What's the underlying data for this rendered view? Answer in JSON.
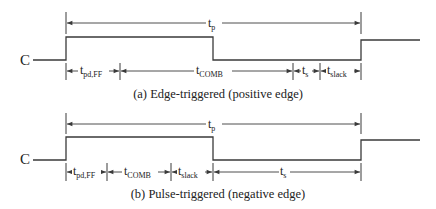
{
  "figure": {
    "panels": [
      {
        "id": "a",
        "caption": "(a) Edge-triggered (positive edge)",
        "signal_label": "C",
        "period": {
          "label": "t",
          "sub": "p"
        },
        "intervals": [
          {
            "label": "t",
            "sub": "pd,FF"
          },
          {
            "label": "t",
            "sub": "COMB"
          },
          {
            "label": "t",
            "sub": "s"
          },
          {
            "label": "t",
            "sub": "slack"
          }
        ]
      },
      {
        "id": "b",
        "caption": "(b) Pulse-triggered (negative edge)",
        "signal_label": "C",
        "period": {
          "label": "t",
          "sub": "p"
        },
        "intervals": [
          {
            "label": "t",
            "sub": "pd,FF"
          },
          {
            "label": "t",
            "sub": "COMB"
          },
          {
            "label": "t",
            "sub": "slack"
          },
          {
            "label": "t",
            "sub": "s"
          }
        ]
      }
    ],
    "colors": {
      "line": "#3a3a3a",
      "text": "#222222",
      "background": "#ffffff"
    }
  }
}
